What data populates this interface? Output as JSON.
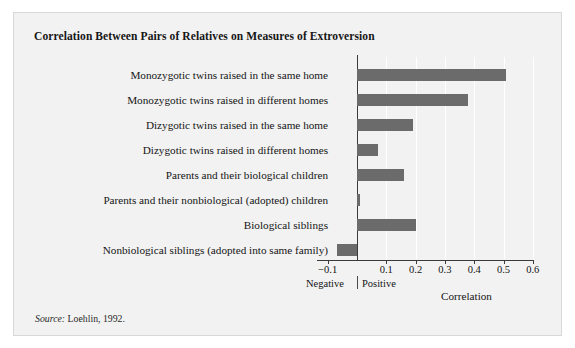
{
  "figure": {
    "title": "Correlation Between Pairs of Relatives on Measures of Extroversion",
    "source_prefix": "Source:",
    "source_text": " Loehlin, 1992.",
    "bar_color": "#6b6b6b",
    "background": "#f2f2f2",
    "rule_color": "#6e6e6e"
  },
  "chart_data": {
    "type": "bar",
    "orientation": "horizontal",
    "title": "Correlation Between Pairs of Relatives on Measures of Extroversion",
    "xlabel": "Correlation",
    "ylabel": "",
    "xlim": [
      -0.1,
      0.6
    ],
    "grid": true,
    "legend": "none",
    "negative_label": "Negative",
    "positive_label": "Positive",
    "tick_labels": [
      "-0.1",
      "0.1",
      "0.2",
      "0.3",
      "0.4",
      "0.5",
      "0.6"
    ],
    "tick_values": [
      -0.1,
      0.1,
      0.2,
      0.3,
      0.4,
      0.5,
      0.6
    ],
    "categories": [
      "Monozygotic twins raised in the same home",
      "Monozygotic twins raised in different homes",
      "Dizygotic twins raised in the same home",
      "Dizygotic twins raised in different homes",
      "Parents and their biological children",
      "Parents and their nonbiological (adopted) children",
      "Biological siblings",
      "Nonbiological siblings (adopted into same family)"
    ],
    "values": [
      0.51,
      0.38,
      0.19,
      0.07,
      0.16,
      0.01,
      0.2,
      -0.07
    ]
  }
}
